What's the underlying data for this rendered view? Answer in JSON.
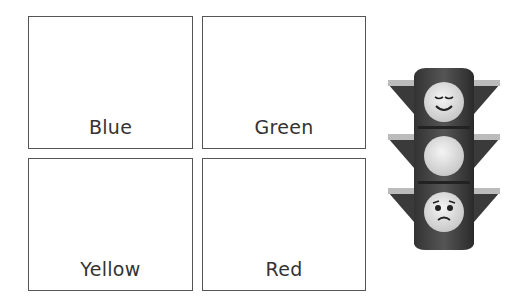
{
  "boxes": [
    {
      "label": "Blue"
    },
    {
      "label": "Green"
    },
    {
      "label": "Yellow"
    },
    {
      "label": "Red"
    }
  ],
  "traffic_light": {
    "lights": [
      "happy-face",
      "blank",
      "sad-face"
    ]
  }
}
